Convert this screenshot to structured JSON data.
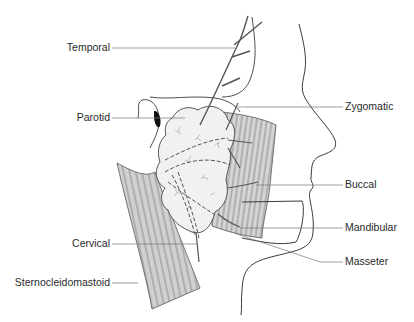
{
  "figure": {
    "colors": {
      "line": "#3a3a3a",
      "muscle_fill": "#cfcfcf",
      "gland_fill": "#efefef",
      "background": "#ffffff"
    }
  },
  "labels": {
    "left": [
      {
        "id": "temporal",
        "text": "Temporal"
      },
      {
        "id": "parotid",
        "text": "Parotid"
      },
      {
        "id": "cervical",
        "text": "Cervical"
      },
      {
        "id": "sternocleidomastoid",
        "text": "Sternocleidomastoid"
      }
    ],
    "right": [
      {
        "id": "zygomatic",
        "text": "Zygomatic"
      },
      {
        "id": "buccal",
        "text": "Buccal"
      },
      {
        "id": "mandibular",
        "text": "Mandibular"
      },
      {
        "id": "masseter",
        "text": "Masseter"
      }
    ]
  }
}
